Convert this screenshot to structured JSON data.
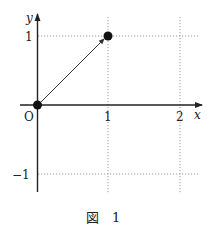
{
  "diagram": {
    "axis_labels": {
      "x": "x",
      "y": "y",
      "origin": "O"
    },
    "x_ticks": [
      "1",
      "2"
    ],
    "y_ticks": [
      "1",
      "−1"
    ],
    "points": [
      {
        "name": "origin-point",
        "x": 0,
        "y": 0
      },
      {
        "name": "point-1-1",
        "x": 1,
        "y": 1
      }
    ],
    "arrow": {
      "from": [
        0,
        0
      ],
      "to": [
        1,
        1
      ]
    },
    "caption": "図　1",
    "colors": {
      "ink": "#222222",
      "grid": "#9a9a9a"
    }
  }
}
